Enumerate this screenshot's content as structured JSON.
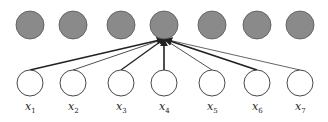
{
  "diagram": {
    "type": "neural-network-connection",
    "top_layer": {
      "count": 7,
      "fill": "#8a8a8a",
      "stroke": "#555555",
      "nodes": [
        {
          "cx": 30
        },
        {
          "cx": 73
        },
        {
          "cx": 121
        },
        {
          "cx": 164
        },
        {
          "cx": 212
        },
        {
          "cx": 257
        },
        {
          "cx": 300
        }
      ],
      "cy": 25,
      "r": 14
    },
    "bottom_layer": {
      "count": 7,
      "fill": "#ffffff",
      "stroke": "#333333",
      "cy": 83,
      "r": 13,
      "nodes": [
        {
          "cx": 30,
          "label": "x",
          "sub": "1",
          "weight": 1.6
        },
        {
          "cx": 73,
          "label": "x",
          "sub": "2",
          "weight": 0.8
        },
        {
          "cx": 121,
          "label": "x",
          "sub": "3",
          "weight": 1.3
        },
        {
          "cx": 164,
          "label": "x",
          "sub": "4",
          "weight": 1.6
        },
        {
          "cx": 212,
          "label": "x",
          "sub": "5",
          "weight": 0.8
        },
        {
          "cx": 257,
          "label": "x",
          "sub": "6",
          "weight": 1.8
        },
        {
          "cx": 300,
          "label": "x",
          "sub": "7",
          "weight": 0.7
        }
      ]
    },
    "target_node_index": 3,
    "edge_color": "#222222",
    "label_y": 110
  }
}
